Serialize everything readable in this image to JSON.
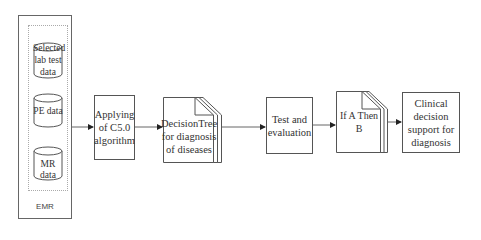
{
  "diagram": {
    "emr": {
      "label": "EMR",
      "sources": [
        {
          "id": "lab",
          "lines": [
            "Selected",
            "lab test",
            "data"
          ]
        },
        {
          "id": "pe",
          "lines": [
            "PE data"
          ]
        },
        {
          "id": "mr",
          "lines": [
            "MR data"
          ]
        }
      ]
    },
    "steps": [
      {
        "id": "c50",
        "shape": "process",
        "lines": [
          "Applying",
          "of C5.0",
          "algorithm"
        ]
      },
      {
        "id": "tree",
        "shape": "multi-document",
        "lines": [
          "DecisionTree",
          "for diagnosis",
          "of diseases"
        ]
      },
      {
        "id": "test",
        "shape": "process",
        "lines": [
          "Test and",
          "evaluation"
        ]
      },
      {
        "id": "rules",
        "shape": "multi-document",
        "lines": [
          "If A Then B"
        ]
      },
      {
        "id": "cds",
        "shape": "process",
        "lines": [
          "Clinical",
          "decision",
          "support for",
          "diagnosis"
        ]
      }
    ],
    "colors": {
      "stroke": "#555555",
      "background": "#ffffff",
      "text": "#333333"
    }
  }
}
